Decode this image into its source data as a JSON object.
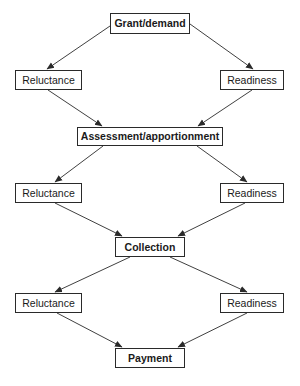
{
  "diagram": {
    "nodes": [
      {
        "id": "grant",
        "label": "Grant/demand",
        "bold": true,
        "x": 110,
        "y": 13,
        "w": 80,
        "h": 21
      },
      {
        "id": "reluctance1",
        "label": "Reluctance",
        "bold": false,
        "x": 15,
        "y": 70,
        "w": 67,
        "h": 20
      },
      {
        "id": "readiness1",
        "label": "Readiness",
        "bold": false,
        "x": 220,
        "y": 70,
        "w": 64,
        "h": 20
      },
      {
        "id": "assessment",
        "label": "Assessment/apportionment",
        "bold": true,
        "x": 77,
        "y": 127,
        "w": 146,
        "h": 19
      },
      {
        "id": "reluctance2",
        "label": "Reluctance",
        "bold": false,
        "x": 15,
        "y": 183,
        "w": 67,
        "h": 20
      },
      {
        "id": "readiness2",
        "label": "Readiness",
        "bold": false,
        "x": 220,
        "y": 183,
        "w": 64,
        "h": 20
      },
      {
        "id": "collection",
        "label": "Collection",
        "bold": true,
        "x": 115,
        "y": 237,
        "w": 70,
        "h": 20
      },
      {
        "id": "reluctance3",
        "label": "Reluctance",
        "bold": false,
        "x": 15,
        "y": 293,
        "w": 67,
        "h": 20
      },
      {
        "id": "readiness3",
        "label": "Readiness",
        "bold": false,
        "x": 220,
        "y": 293,
        "w": 64,
        "h": 20
      },
      {
        "id": "payment",
        "label": "Payment",
        "bold": true,
        "x": 115,
        "y": 348,
        "w": 70,
        "h": 20
      }
    ],
    "edges": [
      {
        "from": "grant",
        "to": "reluctance1",
        "x1": 110,
        "y1": 26,
        "x2": 47,
        "y2": 69
      },
      {
        "from": "grant",
        "to": "readiness1",
        "x1": 190,
        "y1": 24,
        "x2": 253,
        "y2": 69
      },
      {
        "from": "reluctance1",
        "to": "assessment",
        "x1": 48,
        "y1": 90,
        "x2": 102,
        "y2": 126
      },
      {
        "from": "readiness1",
        "to": "assessment",
        "x1": 252,
        "y1": 90,
        "x2": 198,
        "y2": 126
      },
      {
        "from": "assessment",
        "to": "reluctance2",
        "x1": 103,
        "y1": 146,
        "x2": 55,
        "y2": 182
      },
      {
        "from": "assessment",
        "to": "readiness2",
        "x1": 197,
        "y1": 146,
        "x2": 247,
        "y2": 182
      },
      {
        "from": "reluctance2",
        "to": "collection",
        "x1": 55,
        "y1": 203,
        "x2": 122,
        "y2": 236
      },
      {
        "from": "readiness2",
        "to": "collection",
        "x1": 245,
        "y1": 203,
        "x2": 178,
        "y2": 236
      },
      {
        "from": "collection",
        "to": "reluctance3",
        "x1": 130,
        "y1": 257,
        "x2": 55,
        "y2": 292
      },
      {
        "from": "collection",
        "to": "readiness3",
        "x1": 170,
        "y1": 257,
        "x2": 247,
        "y2": 292
      },
      {
        "from": "reluctance3",
        "to": "payment",
        "x1": 57,
        "y1": 313,
        "x2": 122,
        "y2": 347
      },
      {
        "from": "readiness3",
        "to": "payment",
        "x1": 247,
        "y1": 313,
        "x2": 178,
        "y2": 347
      }
    ],
    "colors": {
      "stroke": "#2a2a2a",
      "text": "#1a1a1a",
      "background": "#ffffff"
    }
  }
}
